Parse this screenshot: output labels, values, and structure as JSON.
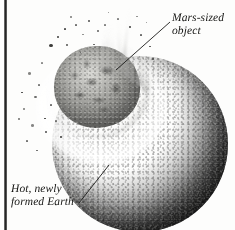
{
  "figure": {
    "background_color": "#fdfdfc",
    "edge_bar_color": "#1d1d1d",
    "width": 235,
    "height": 230
  },
  "annotations": [
    {
      "name": "mars-sized-object",
      "lines": [
        "Mars-sized",
        "object"
      ],
      "line1": "Mars-sized",
      "line2": "object",
      "position": "top-right",
      "leader": "line from text down-left to impactor"
    },
    {
      "name": "hot-newly-formed-earth",
      "lines": [
        "Hot, newly",
        "formed Earth"
      ],
      "line1": "Hot, newly",
      "line2": "formed Earth",
      "position": "bottom-left",
      "leader": "line from text up-right into Earth's surface"
    }
  ],
  "objects": {
    "earth": {
      "name": "hot-newly-formed-earth",
      "description": "Large dark speckled molten sphere, lit from upper-left",
      "fill_light": "#8e8e8a",
      "fill_dark": "#040404"
    },
    "impactor": {
      "name": "mars-sized-object",
      "description": "Smaller rough gray body with dark mottled patches impacting upper-left of Earth",
      "fill_light": "#d8d8d4",
      "fill_dark": "#6a6a67"
    },
    "ejecta": {
      "name": "impact-ejecta-plume",
      "description": "Bright white rays and plume radiating from the impact site",
      "color": "#ffffff"
    },
    "debris": {
      "name": "debris-field",
      "description": "Scattered dark specks thrown off above and left of the impact",
      "color": "#2c2c2a"
    }
  }
}
